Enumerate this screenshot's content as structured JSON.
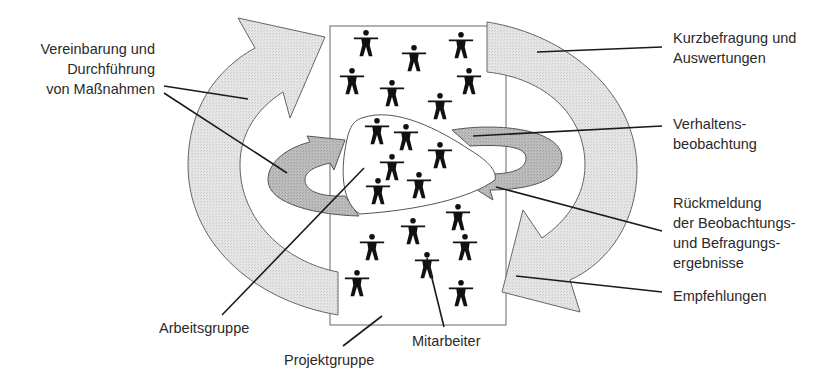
{
  "diagram": {
    "type": "process-cycle",
    "colors": {
      "outer_arrow_fill": "#e4e4e4",
      "inner_arrow_fill": "#b9b9b9",
      "stroke": "#555555",
      "figure": "#111111",
      "leader_line": "#1a1a1a"
    },
    "labels": {
      "vereinbarung": {
        "line1": "Vereinbarung und",
        "line2": "Durchführung",
        "line3": "von Maßnahmen"
      },
      "kurzbefragung": {
        "line1": "Kurzbefragung und",
        "line2": "Auswertungen"
      },
      "verhaltens": {
        "line1": "Verhaltens-",
        "line2": "beobachtung"
      },
      "rueckmeldung": {
        "line1": "Rückmeldung",
        "line2": "der Beobachtungs-",
        "line3": "und Befragungs-",
        "line4": "ergebnisse"
      },
      "empfehlungen": "Empfehlungen",
      "arbeitsgruppe": "Arbeitsgruppe",
      "projektgruppe": "Projektgruppe",
      "mitarbeiter": "Mitarbeiter"
    },
    "icons": {
      "person": "person-icon",
      "cycle_arrow": "curved-arrow-icon"
    }
  }
}
